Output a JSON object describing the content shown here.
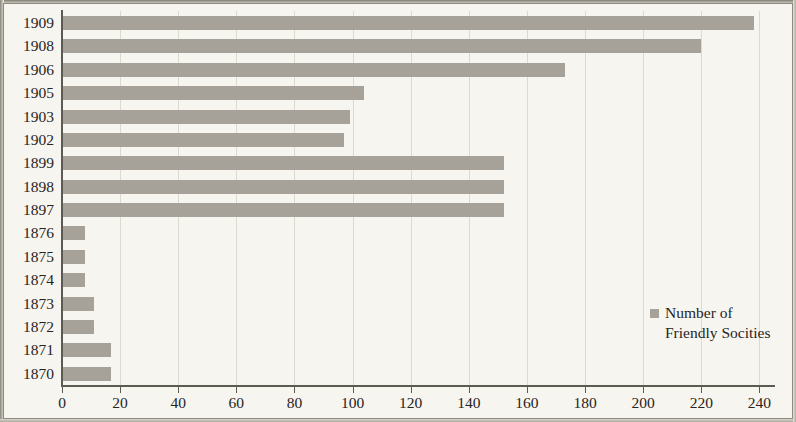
{
  "chart_data": {
    "type": "bar",
    "orientation": "horizontal",
    "title": "",
    "subtitle": "",
    "xlabel": "",
    "ylabel": "",
    "xlim": [
      0,
      245
    ],
    "ylim": null,
    "grid": true,
    "grid_axis": "x",
    "legend_position": "inside-right",
    "categories": [
      "1909",
      "1908",
      "1906",
      "1905",
      "1903",
      "1902",
      "1899",
      "1898",
      "1897",
      "1876",
      "1875",
      "1874",
      "1873",
      "1872",
      "1871",
      "1870"
    ],
    "values": [
      238,
      220,
      173,
      104,
      99,
      97,
      152,
      152,
      152,
      8,
      8,
      8,
      11,
      11,
      17,
      17
    ],
    "xticks": [
      0,
      20,
      40,
      60,
      80,
      100,
      120,
      140,
      160,
      180,
      200,
      220,
      240
    ],
    "xtick_labels": [
      "0",
      "20",
      "40",
      "60",
      "80",
      "100",
      "120",
      "140",
      "160",
      "180",
      "200",
      "220",
      "240"
    ],
    "series": [
      {
        "name": "Number of Friendly Socities",
        "color": "#a6a299",
        "values": [
          238,
          220,
          173,
          104,
          99,
          97,
          152,
          152,
          152,
          8,
          8,
          8,
          11,
          11,
          17,
          17
        ]
      }
    ]
  },
  "legend": {
    "swatch_color": "#a6a299",
    "line1": "Number of",
    "line2": "Friendly Socities"
  },
  "style": {
    "background": "#f7f5ef",
    "bar_color": "#a6a299",
    "axis_color": "#5d5a52",
    "grid_color": "#ddd9cf",
    "text_color": "#27241e"
  }
}
